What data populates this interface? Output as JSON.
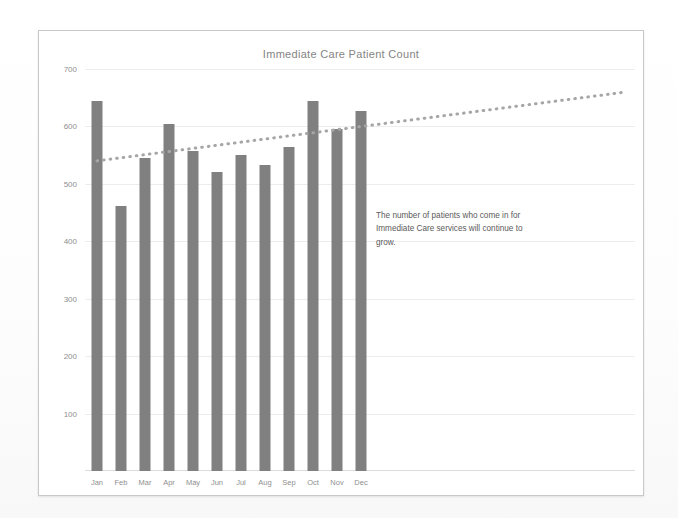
{
  "chart_data": {
    "type": "bar",
    "title": "Immediate Care Patient Count",
    "xlabel": "",
    "ylabel": "",
    "categories": [
      "Jan",
      "Feb",
      "Mar",
      "Apr",
      "May",
      "Jun",
      "Jul",
      "Aug",
      "Sep",
      "Oct",
      "Nov",
      "Dec"
    ],
    "values": [
      645,
      462,
      545,
      605,
      558,
      520,
      550,
      533,
      565,
      645,
      595,
      627
    ],
    "series": [
      {
        "name": "Patient Count",
        "type": "bar",
        "values": [
          645,
          462,
          545,
          605,
          558,
          520,
          550,
          533,
          565,
          645,
          595,
          627
        ],
        "color": "#808080"
      },
      {
        "name": "Trendline",
        "type": "line",
        "style": "dotted",
        "color": "#a6a6a6",
        "start_value": 540,
        "end_value": 660,
        "note": "dotted linear trend extending past Dec to right edge of plot"
      }
    ],
    "ylim": [
      0,
      700
    ],
    "yticks": [
      100,
      200,
      300,
      400,
      500,
      600,
      700
    ],
    "ytick_labels": [
      "100",
      "200",
      "300",
      "400",
      "500",
      "600",
      "700"
    ],
    "grid": true,
    "legend": false,
    "annotations": [
      {
        "text": "The number of patients who come in for Immediate Care services will continue to grow.",
        "position": "center-right"
      }
    ]
  },
  "chart": {
    "title": "Immediate Care Patient Count",
    "annotation_text": "The number of patients who come in for Immediate Care services will continue to grow.",
    "bar_color": "#808080",
    "trend_color": "#a6a6a6",
    "grid_color": "#ededed",
    "frame_color": "#c9c9c9",
    "axis_label_color": "#8f8f8f",
    "title_color": "#848484"
  }
}
